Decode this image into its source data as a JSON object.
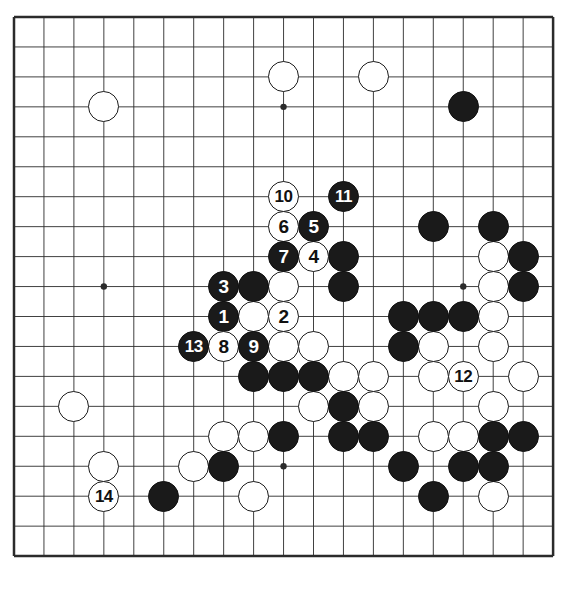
{
  "diagram": {
    "kind": "go-game-diagram",
    "board_size": 19,
    "background_color": "#ffffff",
    "line_color": "#2b2b2b",
    "black_color": "#1a1a1a",
    "white_color": "#ffffff",
    "geometry": {
      "x0": 14,
      "y0": 17,
      "step": 29.95,
      "stone_diameter": 31,
      "border_width": 2.5,
      "star_radius": 3.2
    },
    "star_points": [
      {
        "col": 3,
        "row": 3
      },
      {
        "col": 9,
        "row": 3
      },
      {
        "col": 15,
        "row": 3
      },
      {
        "col": 3,
        "row": 9
      },
      {
        "col": 9,
        "row": 9
      },
      {
        "col": 15,
        "row": 9
      },
      {
        "col": 3,
        "row": 15
      },
      {
        "col": 9,
        "row": 15
      },
      {
        "col": 15,
        "row": 15
      }
    ],
    "numbered_moves": [
      {
        "n": "1",
        "color": "black",
        "col": 7,
        "row": 10
      },
      {
        "n": "2",
        "color": "white",
        "col": 9,
        "row": 10
      },
      {
        "n": "3",
        "color": "black",
        "col": 7,
        "row": 9
      },
      {
        "n": "4",
        "color": "white",
        "col": 10,
        "row": 8
      },
      {
        "n": "5",
        "color": "black",
        "col": 10,
        "row": 7
      },
      {
        "n": "6",
        "color": "white",
        "col": 9,
        "row": 7
      },
      {
        "n": "7",
        "color": "black",
        "col": 9,
        "row": 8
      },
      {
        "n": "8",
        "color": "white",
        "col": 7,
        "row": 11
      },
      {
        "n": "9",
        "color": "black",
        "col": 8,
        "row": 11
      },
      {
        "n": "10",
        "color": "white",
        "col": 9,
        "row": 6
      },
      {
        "n": "11",
        "color": "black",
        "col": 11,
        "row": 6
      },
      {
        "n": "12",
        "color": "white",
        "col": 15,
        "row": 12
      },
      {
        "n": "13",
        "color": "black",
        "col": 6,
        "row": 11
      },
      {
        "n": "14",
        "color": "white",
        "col": 3,
        "row": 16
      }
    ],
    "black_stones": [
      {
        "col": 15,
        "row": 3
      },
      {
        "col": 14,
        "row": 7
      },
      {
        "col": 16,
        "row": 7
      },
      {
        "col": 11,
        "row": 8
      },
      {
        "col": 17,
        "row": 8
      },
      {
        "col": 8,
        "row": 9
      },
      {
        "col": 11,
        "row": 9
      },
      {
        "col": 17,
        "row": 9
      },
      {
        "col": 13,
        "row": 10
      },
      {
        "col": 14,
        "row": 10
      },
      {
        "col": 15,
        "row": 10
      },
      {
        "col": 13,
        "row": 11
      },
      {
        "col": 8,
        "row": 12
      },
      {
        "col": 9,
        "row": 12
      },
      {
        "col": 10,
        "row": 12
      },
      {
        "col": 11,
        "row": 13
      },
      {
        "col": 9,
        "row": 14
      },
      {
        "col": 11,
        "row": 14
      },
      {
        "col": 12,
        "row": 14
      },
      {
        "col": 16,
        "row": 14
      },
      {
        "col": 17,
        "row": 14
      },
      {
        "col": 7,
        "row": 15
      },
      {
        "col": 13,
        "row": 15
      },
      {
        "col": 15,
        "row": 15
      },
      {
        "col": 16,
        "row": 15
      },
      {
        "col": 5,
        "row": 16
      },
      {
        "col": 14,
        "row": 16
      }
    ],
    "white_stones": [
      {
        "col": 9,
        "row": 2
      },
      {
        "col": 12,
        "row": 2
      },
      {
        "col": 3,
        "row": 3
      },
      {
        "col": 16,
        "row": 8
      },
      {
        "col": 9,
        "row": 9
      },
      {
        "col": 16,
        "row": 9
      },
      {
        "col": 8,
        "row": 10
      },
      {
        "col": 16,
        "row": 10
      },
      {
        "col": 9,
        "row": 11
      },
      {
        "col": 10,
        "row": 11
      },
      {
        "col": 14,
        "row": 11
      },
      {
        "col": 16,
        "row": 11
      },
      {
        "col": 11,
        "row": 12
      },
      {
        "col": 12,
        "row": 12
      },
      {
        "col": 14,
        "row": 12
      },
      {
        "col": 17,
        "row": 12
      },
      {
        "col": 2,
        "row": 13
      },
      {
        "col": 10,
        "row": 13
      },
      {
        "col": 12,
        "row": 13
      },
      {
        "col": 16,
        "row": 13
      },
      {
        "col": 7,
        "row": 14
      },
      {
        "col": 8,
        "row": 14
      },
      {
        "col": 14,
        "row": 14
      },
      {
        "col": 15,
        "row": 14
      },
      {
        "col": 3,
        "row": 15
      },
      {
        "col": 6,
        "row": 15
      },
      {
        "col": 8,
        "row": 16
      },
      {
        "col": 16,
        "row": 16
      }
    ]
  }
}
